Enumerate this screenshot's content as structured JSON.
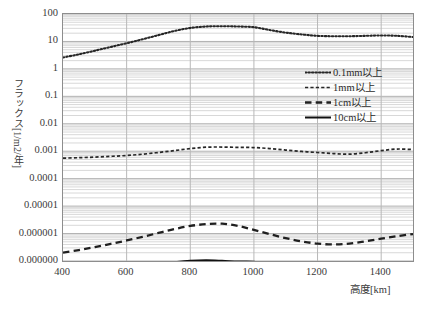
{
  "chart_data": {
    "type": "line",
    "title": "",
    "xlabel": "高度[km]",
    "ylabel": "フラックス[1/m2/年]",
    "xlim": [
      400,
      1500
    ],
    "ylim": [
      1e-07,
      100
    ],
    "yscale": "log",
    "xscale": "linear",
    "grid": true,
    "grid_minor": true,
    "legend_position": "upper right",
    "xticks": [
      400,
      600,
      800,
      1000,
      1200,
      1400
    ],
    "xticklabels": [
      "400",
      "600",
      "800",
      "1000",
      "1200",
      "1400"
    ],
    "yticks": [
      100,
      10,
      1,
      0.1,
      0.01,
      0.001,
      0.0001,
      1e-05,
      1e-06,
      1e-07
    ],
    "yticklabels": [
      "100",
      "10",
      "1",
      "0.1",
      "0.01",
      "0.001",
      "0.0001",
      "0.00001",
      "0.000001",
      "0.000000"
    ],
    "x": [
      400,
      450,
      500,
      550,
      600,
      650,
      700,
      750,
      800,
      850,
      900,
      950,
      1000,
      1050,
      1100,
      1150,
      1200,
      1250,
      1300,
      1350,
      1400,
      1450,
      1500
    ],
    "series": [
      {
        "name": "0.1mm以上",
        "style": "dotted",
        "color": "#262626",
        "values": [
          2.6,
          3.4,
          4.6,
          6.3,
          8.6,
          12.0,
          17.0,
          24.0,
          31.0,
          35.0,
          36.0,
          35.0,
          33.0,
          26.0,
          21.0,
          18.0,
          16.0,
          15.5,
          15.5,
          16.0,
          16.5,
          16.0,
          14.5
        ]
      },
      {
        "name": "1mm以上",
        "style": "dashed-fine",
        "color": "#262626",
        "values": [
          0.00056,
          0.00058,
          0.00061,
          0.00065,
          0.0007,
          0.00078,
          0.0009,
          0.00105,
          0.00125,
          0.0014,
          0.00142,
          0.00138,
          0.00136,
          0.00125,
          0.0011,
          0.00098,
          0.0009,
          0.00082,
          0.00078,
          0.00088,
          0.00105,
          0.0012,
          0.00115
        ]
      },
      {
        "name": "1cm以上",
        "style": "dashed",
        "color": "#1f1f1f",
        "values": [
          2e-07,
          2.5e-07,
          3.2e-07,
          4.2e-07,
          5.6e-07,
          7.6e-07,
          1.05e-06,
          1.45e-06,
          1.9e-06,
          2.2e-06,
          2.3e-06,
          1.9e-06,
          1.35e-06,
          9.5e-07,
          6.8e-07,
          5.2e-07,
          4.3e-07,
          4e-07,
          4.3e-07,
          5.2e-07,
          6.5e-07,
          8e-07,
          9.6e-07
        ]
      },
      {
        "name": "10cm以上",
        "style": "solid",
        "color": "#111111",
        "values": [
          1.45e-08,
          1.8e-08,
          2.4e-08,
          3.3e-08,
          4.4e-08,
          5.8e-08,
          7.4e-08,
          9e-08,
          1.02e-07,
          1.06e-07,
          1.02e-07,
          9.6e-08,
          9.4e-08,
          7.2e-08,
          4.6e-08,
          3.3e-08,
          2.7e-08,
          2.2e-08,
          1.6e-08,
          3.4e-08,
          5.6e-08,
          6e-08,
          4.6e-08
        ]
      }
    ]
  },
  "axes": {
    "y_title": "フラックス[1/m2/年]",
    "x_title": "高度[km]"
  },
  "legend": {
    "items": [
      {
        "label": "0.1mm以上",
        "key": "dotted-line-key"
      },
      {
        "label": "1mm以上",
        "key": "fine-dashed-line-key"
      },
      {
        "label": "1cm以上",
        "key": "dashed-line-key"
      },
      {
        "label": "10cm以上",
        "key": "solid-line-key"
      }
    ]
  }
}
